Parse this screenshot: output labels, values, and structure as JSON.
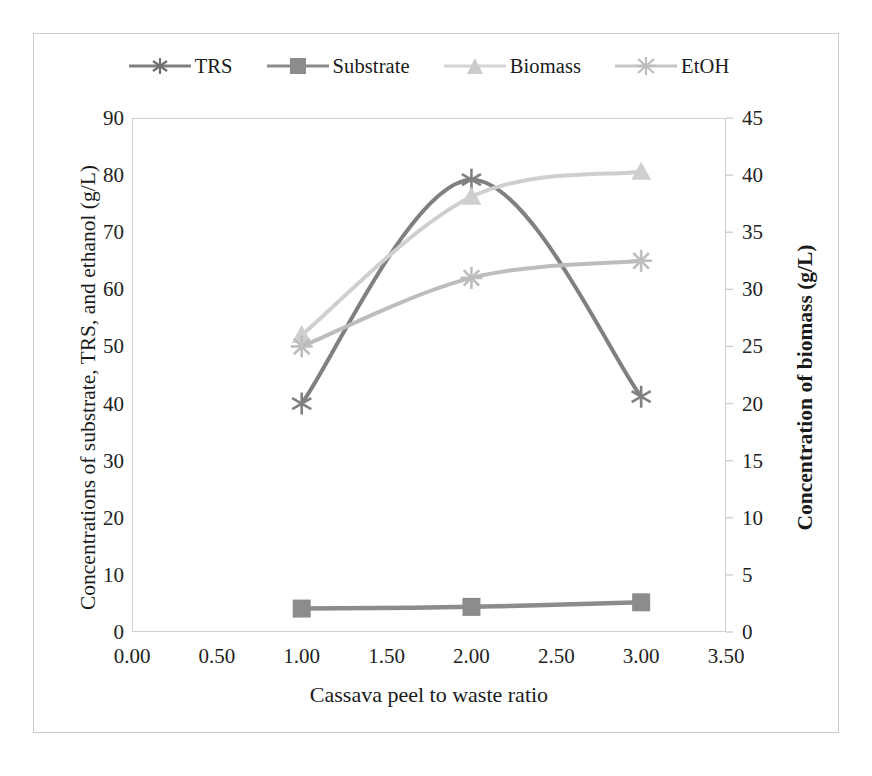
{
  "chart_data": {
    "type": "line",
    "title": "",
    "xlabel": "Cassava peel to waste ratio",
    "ylabel": "Concentrations of substrate, TRS, and ethanol (g/L)",
    "ylabel_right": "Concentration of biomass (g/L)",
    "x": [
      1.0,
      2.0,
      3.0
    ],
    "xlim": [
      0.0,
      3.5
    ],
    "ylim": [
      0,
      90
    ],
    "ylim_right": [
      0,
      45
    ],
    "xticks": [
      "0.00",
      "0.50",
      "1.00",
      "1.50",
      "2.00",
      "2.50",
      "3.00",
      "3.50"
    ],
    "xtick_values": [
      0.0,
      0.5,
      1.0,
      1.5,
      2.0,
      2.5,
      3.0,
      3.5
    ],
    "yticks": [
      "0",
      "10",
      "20",
      "30",
      "40",
      "50",
      "60",
      "70",
      "80",
      "90"
    ],
    "ytick_values": [
      0,
      10,
      20,
      30,
      40,
      50,
      60,
      70,
      80,
      90
    ],
    "yticks_right": [
      "0",
      "5",
      "10",
      "15",
      "20",
      "25",
      "30",
      "35",
      "40",
      "45"
    ],
    "ytick_right_values": [
      0,
      5,
      10,
      15,
      20,
      25,
      30,
      35,
      40,
      45
    ],
    "grid": false,
    "legend_position": "top",
    "series": [
      {
        "name": "TRS",
        "axis": "left",
        "marker": "asterisk",
        "color": "#808080",
        "values": [
          40.0,
          79.2,
          41.2
        ]
      },
      {
        "name": "Substrate",
        "axis": "left",
        "marker": "square",
        "color": "#8c8c8c",
        "values": [
          4.1,
          4.4,
          5.2
        ]
      },
      {
        "name": "Biomass",
        "axis": "right",
        "marker": "triangle",
        "color": "#cfcfcf",
        "values": [
          26.0,
          38.1,
          40.3
        ]
      },
      {
        "name": "EtOH",
        "axis": "left",
        "marker": "asterisk",
        "color": "#bdbdbd",
        "values": [
          50.0,
          62.0,
          65.0
        ]
      }
    ]
  },
  "legend": {
    "entries": [
      {
        "label": "TRS"
      },
      {
        "label": "Substrate"
      },
      {
        "label": "Biomass"
      },
      {
        "label": "EtOH"
      }
    ]
  },
  "colors": {
    "trs": "#808080",
    "substrate": "#8c8c8c",
    "biomass": "#cfcfcf",
    "etoh": "#bdbdbd",
    "frame": "#cfcfcf",
    "text": "#1a1a1a"
  }
}
